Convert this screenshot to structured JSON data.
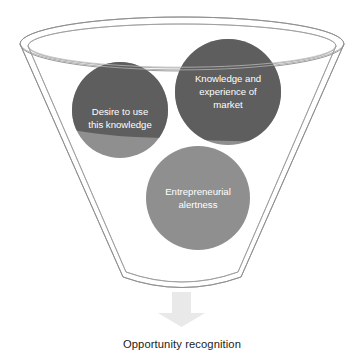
{
  "diagram": {
    "type": "funnel-concept-diagram",
    "funnel": {
      "name": "funnel-shape",
      "rim_style": "double-ellipse",
      "outline_color": "#8a8a8a",
      "fill_color": "#ffffff",
      "bottom_style": "rounded"
    },
    "circles": [
      {
        "id": "desire",
        "label_lines": [
          "Desire to use",
          "this knowledge"
        ],
        "color_top": "#5e5e5e",
        "color_bottom": "#8f8f8f",
        "text_color": "#ffffff",
        "cx": 120,
        "cy": 110,
        "r": 48
      },
      {
        "id": "knowledge",
        "label_lines": [
          "Knowledge and",
          "experience of",
          "market"
        ],
        "color_top": "#5e5e5e",
        "color_bottom": "#8f8f8f",
        "text_color": "#ffffff",
        "cx": 228,
        "cy": 92,
        "r": 53
      },
      {
        "id": "alertness",
        "label_lines": [
          "Entrepreneurial",
          "alertness"
        ],
        "color_top": "#8f8f8f",
        "color_bottom": "#8f8f8f",
        "text_color": "#ffffff",
        "cx": 198,
        "cy": 198,
        "r": 52
      }
    ],
    "arrow": {
      "name": "down-arrow",
      "color": "#e9e9e9",
      "direction": "down"
    },
    "caption": "Opportunity recognition"
  }
}
